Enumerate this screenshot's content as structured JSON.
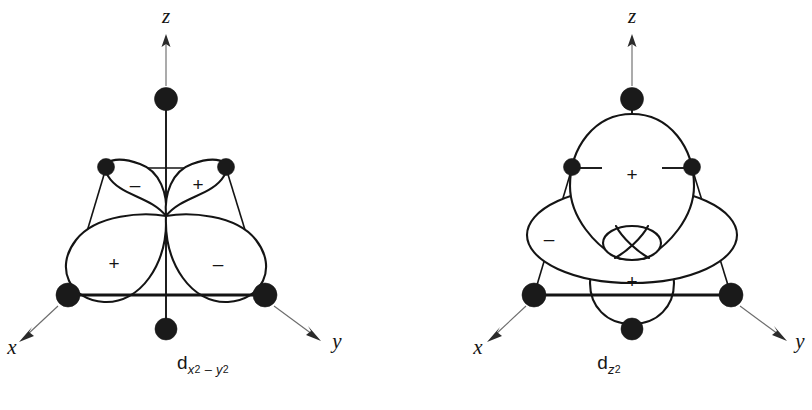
{
  "figure": {
    "kind": "orbital-diagram-pair",
    "background_color": "#ffffff",
    "ink_color": "#141414",
    "axis_color": "#6d6d6d"
  },
  "panels": [
    {
      "id": "d-x2-y2",
      "caption": {
        "symbol": "d",
        "sub_first_var": "x",
        "sub_first_exp": "2",
        "sub_operator": "–",
        "sub_second_var": "y",
        "sub_second_exp": "2",
        "plain": "d x2 - y2"
      },
      "axes": [
        {
          "name": "z-axis",
          "label": "z",
          "direction": "up"
        },
        {
          "name": "x-axis",
          "label": "x",
          "direction": "down-left"
        },
        {
          "name": "y-axis",
          "label": "y",
          "direction": "down-right"
        }
      ],
      "orbital": {
        "type": "d-x2-y2",
        "lobe_count": 4,
        "lobes": [
          {
            "position": "upper-left",
            "sign": "–"
          },
          {
            "position": "upper-right",
            "sign": "+"
          },
          {
            "position": "lower-left",
            "sign": "+"
          },
          {
            "position": "lower-right",
            "sign": "–"
          }
        ]
      },
      "ligands": [
        {
          "position": "top",
          "size": "large"
        },
        {
          "position": "rear-left",
          "size": "small"
        },
        {
          "position": "rear-right",
          "size": "small"
        },
        {
          "position": "front-left",
          "size": "large"
        },
        {
          "position": "front-right",
          "size": "large"
        },
        {
          "position": "bottom",
          "size": "large"
        }
      ],
      "ligand_count": 6,
      "geometry": "octahedral"
    },
    {
      "id": "d-z2",
      "caption": {
        "symbol": "d",
        "sub_first_var": "z",
        "sub_first_exp": "2",
        "sub_operator": "",
        "sub_second_var": "",
        "sub_second_exp": "",
        "plain": "d z2"
      },
      "axes": [
        {
          "name": "z-axis",
          "label": "z",
          "direction": "up"
        },
        {
          "name": "x-axis",
          "label": "x",
          "direction": "down-left"
        },
        {
          "name": "y-axis",
          "label": "y",
          "direction": "down-right"
        }
      ],
      "orbital": {
        "type": "d-z2",
        "lobe_count": 2,
        "has_torus": true,
        "lobes": [
          {
            "position": "upper",
            "sign": "+"
          },
          {
            "position": "lower",
            "sign": "+"
          }
        ],
        "torus": {
          "position": "equatorial",
          "sign": "–"
        }
      },
      "ligands": [
        {
          "position": "top",
          "size": "large"
        },
        {
          "position": "rear-left",
          "size": "small"
        },
        {
          "position": "rear-right",
          "size": "small"
        },
        {
          "position": "front-left",
          "size": "large"
        },
        {
          "position": "front-right",
          "size": "large"
        },
        {
          "position": "bottom",
          "size": "large"
        }
      ],
      "ligand_count": 6,
      "geometry": "octahedral"
    }
  ]
}
